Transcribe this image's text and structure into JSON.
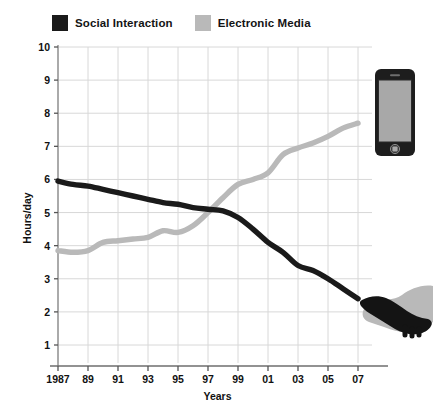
{
  "chart_data": {
    "type": "line",
    "title": "",
    "subtitle": "",
    "xlabel": "Years",
    "ylabel": "Hours/day",
    "xlim": [
      1987,
      2007
    ],
    "ylim": [
      0,
      10
    ],
    "grid": true,
    "legend_position": "top-left",
    "x_tick_labels": [
      "1987",
      "89",
      "91",
      "93",
      "95",
      "97",
      "99",
      "01",
      "03",
      "05",
      "07"
    ],
    "x_tick_values": [
      1987,
      1989,
      1991,
      1993,
      1995,
      1997,
      1999,
      2001,
      2003,
      2005,
      2007
    ],
    "y_tick_labels": [
      "10",
      "9",
      "8",
      "7",
      "6",
      "5",
      "4",
      "3",
      "2",
      "1"
    ],
    "y_tick_values": [
      10,
      9,
      8,
      7,
      6,
      5,
      4,
      3,
      2,
      1
    ],
    "x": [
      1987,
      1988,
      1989,
      1990,
      1991,
      1992,
      1993,
      1994,
      1995,
      1996,
      1997,
      1998,
      1999,
      2000,
      2001,
      2002,
      2003,
      2004,
      2005,
      2006,
      2007
    ],
    "series": [
      {
        "name": "Social Interaction",
        "color": "#1a1a1a",
        "values": [
          5.95,
          5.85,
          5.8,
          5.7,
          5.6,
          5.5,
          5.4,
          5.3,
          5.25,
          5.15,
          5.1,
          5.05,
          4.85,
          4.5,
          4.1,
          3.8,
          3.4,
          3.25,
          3.0,
          2.7,
          2.4
        ]
      },
      {
        "name": "Electronic Media",
        "color": "#b9b9b9",
        "values": [
          3.85,
          3.8,
          3.85,
          4.1,
          4.15,
          4.2,
          4.25,
          4.45,
          4.4,
          4.6,
          5.0,
          5.45,
          5.85,
          6.0,
          6.2,
          6.75,
          6.95,
          7.1,
          7.3,
          7.55,
          7.7
        ]
      }
    ],
    "annotations": [
      {
        "name": "phone-illustration",
        "label": "smartphone"
      },
      {
        "name": "handshake-illustration",
        "label": "handshake"
      }
    ]
  },
  "legend": {
    "entries": [
      {
        "label": "Social Interaction",
        "color": "#1a1a1a"
      },
      {
        "label": "Electronic Media",
        "color": "#b9b9b9"
      }
    ]
  },
  "axes": {
    "y_title": "Hours/day",
    "x_title": "Years"
  }
}
